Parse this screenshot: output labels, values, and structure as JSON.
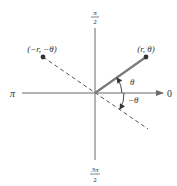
{
  "diagram": {
    "axis_labels": {
      "right": "0",
      "left": "π",
      "top_numerator": "π",
      "top_denominator": "2",
      "bottom_numerator": "3π",
      "bottom_denominator": "2"
    },
    "points": {
      "p1_label": "(r, θ)",
      "p2_label": "(−r, −θ)"
    },
    "angles": {
      "theta": "θ",
      "neg_theta": "−θ"
    },
    "colors": {
      "axis": "#6b6b6b",
      "solid_ray": "#7a7a7a",
      "dashed_ray": "#555555",
      "point": "#333333",
      "text": "#333333"
    }
  }
}
